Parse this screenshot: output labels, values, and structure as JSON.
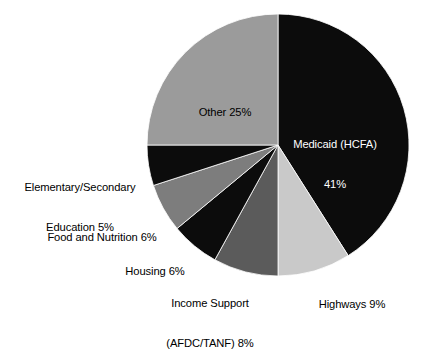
{
  "chart_data": {
    "type": "pie",
    "title": "",
    "subtitle": "",
    "xlabel": "",
    "ylabel": "",
    "legend_position": "none",
    "grid": false,
    "start_angle_deg": 0,
    "direction": "clockwise",
    "units": "percent",
    "categories": [
      "Medicaid (HCFA)",
      "Highways",
      "Income Support (AFDC/TANF)",
      "Housing",
      "Food and Nutrition",
      "Elementary/Secondary Education",
      "Other"
    ],
    "values": [
      41,
      9,
      8,
      6,
      6,
      5,
      25
    ],
    "slices": [
      {
        "key": "medicaid",
        "name": "Medicaid (HCFA)",
        "value": 41,
        "value_text": "41%",
        "color": "#0c0c0c",
        "label_placement": "inside",
        "label_color": "#ffffff",
        "label_lines": [
          "Medicaid (HCFA)",
          "41%"
        ]
      },
      {
        "key": "highways",
        "name": "Highways",
        "value": 9,
        "value_text": "9%",
        "color": "#c9c9c9",
        "label_placement": "outside",
        "label_color": "#000000",
        "label_lines": [
          "Highways 9%"
        ]
      },
      {
        "key": "income-support",
        "name": "Income Support (AFDC/TANF)",
        "value": 8,
        "value_text": "8%",
        "color": "#5b5b5b",
        "label_placement": "outside",
        "label_color": "#000000",
        "label_lines": [
          "Income Support",
          "(AFDC/TANF) 8%"
        ]
      },
      {
        "key": "housing",
        "name": "Housing",
        "value": 6,
        "value_text": "6%",
        "color": "#0c0c0c",
        "label_placement": "outside",
        "label_color": "#000000",
        "label_lines": [
          "Housing 6%"
        ]
      },
      {
        "key": "food-and-nutrition",
        "name": "Food and Nutrition",
        "value": 6,
        "value_text": "6%",
        "color": "#7d7d7d",
        "label_placement": "outside",
        "label_color": "#000000",
        "label_lines": [
          "Food and Nutrition 6%"
        ]
      },
      {
        "key": "elementary-secondary-education",
        "name": "Elementary/Secondary Education",
        "value": 5,
        "value_text": "5%",
        "color": "#0c0c0c",
        "label_placement": "outside",
        "label_color": "#000000",
        "label_lines": [
          "Elementary/Secondary",
          "Education 5%"
        ]
      },
      {
        "key": "other",
        "name": "Other",
        "value": 25,
        "value_text": "25%",
        "color": "#9b9b9b",
        "label_placement": "inside",
        "label_color": "#000000",
        "label_lines": [
          "Other 25%"
        ]
      }
    ]
  },
  "labels": {
    "medicaid_line1": "Medicaid (HCFA)",
    "medicaid_line2": "41%",
    "other": "Other 25%",
    "education_line1": "Elementary/Secondary",
    "education_line2": "Education 5%",
    "food": "Food and Nutrition 6%",
    "housing": "Housing 6%",
    "income_line1": "Income Support",
    "income_line2": "(AFDC/TANF) 8%",
    "highways": "Highways 9%"
  },
  "colors": {
    "background": "#ffffff",
    "text": "#000000",
    "text_on_dark": "#ffffff",
    "slice_black": "#0c0c0c",
    "slice_dark_gray": "#5b5b5b",
    "slice_mid_gray": "#7d7d7d",
    "slice_gray": "#9b9b9b",
    "slice_light_gray": "#c9c9c9"
  },
  "geometry": {
    "center_x": 278,
    "center_y": 145,
    "radius": 131
  }
}
